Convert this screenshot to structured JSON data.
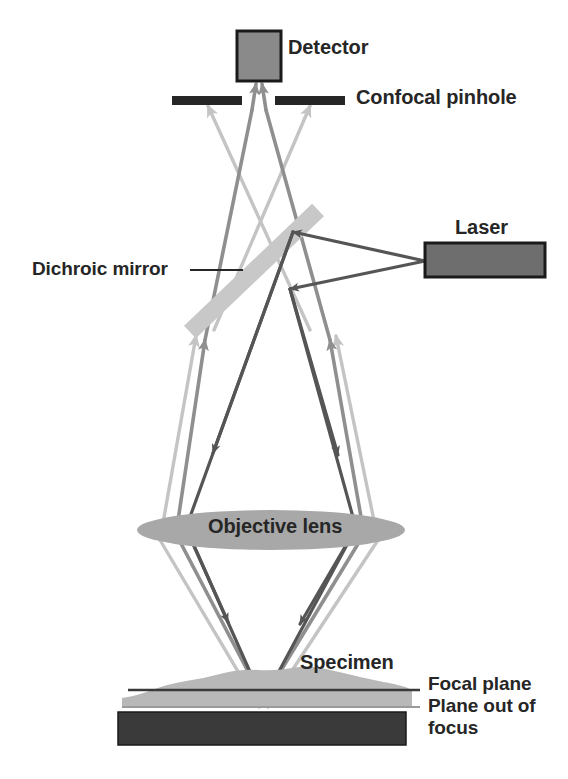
{
  "figure": {
    "background_color": "#ffffff"
  },
  "labels": {
    "detector": "Detector",
    "confocal_pinhole": "Confocal pinhole",
    "laser": "Laser",
    "dichroic_mirror": "Dichroic mirror",
    "objective_lens": "Objective lens",
    "specimen": "Specimen",
    "focal_plane": "Focal plane",
    "plane_out_of_focus_line1": "Plane out of",
    "plane_out_of_focus_line2": "focus"
  },
  "colors": {
    "outline": "#1a1a1a",
    "component_fill": "#8a8a8a",
    "pinhole_fill": "#262626",
    "mirror_fill": "#d2d2d2",
    "mirror_stroke": "#b4b4b4",
    "lens_fill": "#a8a8a8",
    "specimen_fill": "#b8b8b8",
    "slide_fill": "#3a3a3a",
    "focal_plane_line": "#3a3a3a",
    "out_of_focus_line": "#9a9a9a",
    "excitation_ray": "#555555",
    "in_focus_emission_ray": "#8f8f8f",
    "out_of_focus_ray": "#c4c4c4",
    "text": "#262626"
  },
  "components": {
    "detector": {
      "x": 237,
      "y": 31,
      "width": 44,
      "height": 50
    },
    "laser": {
      "x": 425,
      "y": 243,
      "width": 120,
      "height": 34
    },
    "pinhole_left": {
      "x": 172,
      "y": 96,
      "width": 70,
      "height": 9
    },
    "pinhole_right": {
      "x": 275,
      "y": 96,
      "width": 70,
      "height": 9
    },
    "dichroic_mirror": {
      "x1": 190,
      "y1": 332,
      "x2": 318,
      "y2": 210,
      "thickness": 17
    },
    "objective_lens": {
      "cx": 271,
      "cy": 530,
      "rx": 134,
      "ry": 20
    },
    "slide": {
      "x": 118,
      "y": 712,
      "width": 288,
      "height": 33
    },
    "focal_plane_line": {
      "x1": 128,
      "y1": 690,
      "x2": 420,
      "y2": 690
    },
    "out_of_focus_line": {
      "x1": 122,
      "y1": 707,
      "x2": 420,
      "y2": 707
    },
    "focal_point": {
      "x": 263,
      "y": 700
    },
    "dichroic_leader": {
      "x1": 190,
      "y1": 270,
      "x2": 243,
      "y2": 270
    }
  },
  "ray_paths": {
    "excitation": {
      "description": "Laser beam from laser to dichroic mirror, reflected down through objective to focal point",
      "color": "#555555",
      "direction": "laser to specimen"
    },
    "in_focus_emission": {
      "description": "Fluorescence from focal plane back up through objective, through dichroic, through confocal pinhole gap to detector",
      "color": "#8f8f8f",
      "direction": "specimen to detector"
    },
    "out_of_focus_emission": {
      "description": "Light from out-of-focus plane diverges and is blocked by the confocal pinhole screens",
      "color": "#c4c4c4",
      "direction": "specimen to pinhole screen"
    }
  }
}
